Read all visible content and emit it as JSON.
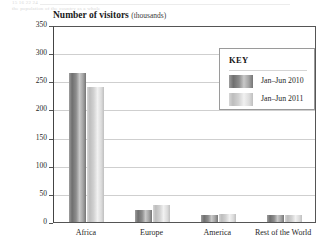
{
  "page_bleed": {
    "line_top": "15    16          22        24",
    "line_bottom": "the population of the country as a whole"
  },
  "chart_data": {
    "type": "bar",
    "title": "Number of visitors",
    "title_unit": "(thousands)",
    "xlabel": "",
    "ylabel": "",
    "ylim": [
      0,
      350
    ],
    "ytick_step": 50,
    "yticks": [
      350,
      300,
      250,
      200,
      150,
      100,
      50,
      0
    ],
    "categories": [
      "Africa",
      "Europe",
      "America",
      "Rest of the World"
    ],
    "series": [
      {
        "name": "Jan–Jun 2010",
        "values": [
          265,
          22,
          13,
          13
        ]
      },
      {
        "name": "Jan–Jun 2011",
        "values": [
          240,
          30,
          15,
          12
        ]
      }
    ],
    "grid": true,
    "legend_position": "upper right",
    "legend_title": "KEY"
  }
}
